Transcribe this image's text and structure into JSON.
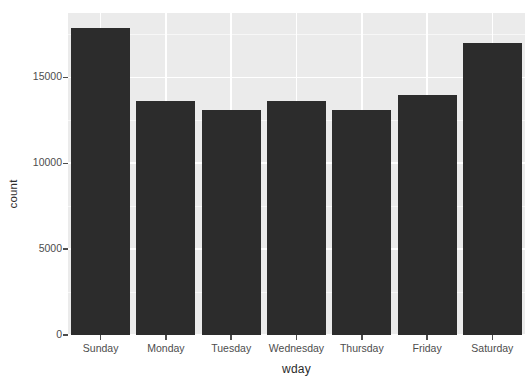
{
  "chart_data": {
    "type": "bar",
    "title": "",
    "subtitle": "",
    "xlabel": "wday",
    "ylabel": "count",
    "categories": [
      "Sunday",
      "Monday",
      "Tuesday",
      "Wednesday",
      "Thursday",
      "Friday",
      "Saturday"
    ],
    "values": [
      17850,
      13620,
      13130,
      13620,
      13130,
      13990,
      16990
    ],
    "series": [
      {
        "name": "count",
        "values": [
          17850,
          13620,
          13130,
          13620,
          13130,
          13990,
          16990
        ]
      }
    ],
    "ylim": [
      0,
      18750
    ],
    "xlim_categorical": true,
    "y_ticks": [
      0,
      5000,
      10000,
      15000
    ],
    "y_tick_labels": [
      "0",
      "5000",
      "10000",
      "15000"
    ],
    "y_minor_ticks": [
      2500,
      7500,
      12500,
      17500
    ],
    "grid": true,
    "grid_color": "#ffffff",
    "grid_minor_color": "#f7f7f7",
    "legend": "none",
    "bar_color": "#2c2c2c",
    "panel_background": "#ebebeb",
    "plot_background": "#ffffff",
    "axis_text_color": "#4d4d4d",
    "axis_title_color": "#2b2b2b"
  },
  "axes": {
    "y_title": "count",
    "x_title": "wday"
  },
  "y_axis": {
    "ticks": [
      {
        "label": "15000",
        "value": 15000
      },
      {
        "label": "10000",
        "value": 10000
      },
      {
        "label": "5000",
        "value": 5000
      },
      {
        "label": "0",
        "value": 0
      }
    ]
  },
  "x_axis": {
    "ticks": [
      {
        "label": "Sunday"
      },
      {
        "label": "Monday"
      },
      {
        "label": "Tuesday"
      },
      {
        "label": "Wednesday"
      },
      {
        "label": "Thursday"
      },
      {
        "label": "Friday"
      },
      {
        "label": "Saturday"
      }
    ]
  }
}
